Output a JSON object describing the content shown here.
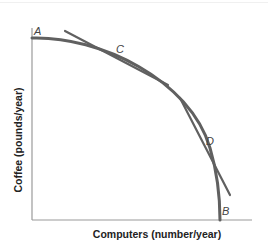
{
  "diagram": {
    "type": "production-possibilities-frontier",
    "x_axis_label": "Computers (number/year)",
    "y_axis_label": "Coffee (pounds/year)",
    "points": [
      {
        "id": "A",
        "label": "A"
      },
      {
        "id": "B",
        "label": "B"
      },
      {
        "id": "C",
        "label": "C"
      },
      {
        "id": "D",
        "label": "D"
      }
    ],
    "colors": {
      "curve": "#606060",
      "tangent": "#606060",
      "axis": "#9a9a9a",
      "label": "#444444"
    }
  }
}
